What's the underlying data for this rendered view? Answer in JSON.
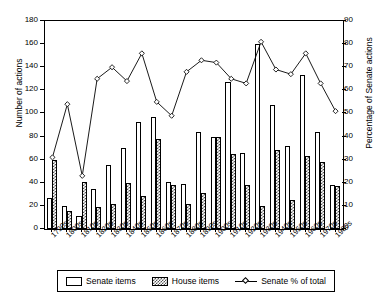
{
  "chart_data": {
    "type": "bar",
    "title": "",
    "xlabel": "",
    "ylabel": "Number of actions",
    "y2label": "Percentage of Senate actions",
    "ylim": [
      0,
      180
    ],
    "y2lim": [
      0,
      90
    ],
    "yticks": [
      0,
      20,
      40,
      60,
      80,
      100,
      120,
      140,
      160,
      180
    ],
    "y2ticks": [
      0,
      10,
      20,
      30,
      40,
      50,
      60,
      70,
      80,
      90
    ],
    "grid": false,
    "legend_position": "bottom",
    "categories": [
      "1790s",
      "1800s",
      "1810s",
      "1820s",
      "1830s",
      "1840s",
      "1850s",
      "1860s",
      "1870s",
      "1880s",
      "1890s",
      "1900s",
      "1910s",
      "1920s",
      "1930s",
      "1940s",
      "1950s",
      "1960s",
      "1970s",
      "1980s"
    ],
    "series": [
      {
        "name": "Senate items",
        "axis": "left",
        "values": [
          27,
          20,
          11,
          35,
          55,
          70,
          93,
          97,
          41,
          39,
          84,
          80,
          127,
          66,
          160,
          107,
          72,
          133,
          84,
          38
        ]
      },
      {
        "name": "House items",
        "axis": "left",
        "values": [
          60,
          16,
          41,
          19,
          22,
          40,
          29,
          78,
          38,
          22,
          31,
          80,
          65,
          38,
          20,
          68,
          25,
          63,
          58,
          37
        ]
      },
      {
        "name": "Senate % of total",
        "axis": "right",
        "marker": "diamond",
        "values": [
          31,
          54,
          23,
          65,
          70,
          64,
          76,
          55,
          49,
          68,
          73,
          72,
          65,
          63,
          81,
          69,
          67,
          76,
          63,
          51
        ]
      }
    ]
  },
  "legend": {
    "senate_label": "Senate items",
    "house_label": "House items",
    "line_label": "Senate % of total"
  }
}
